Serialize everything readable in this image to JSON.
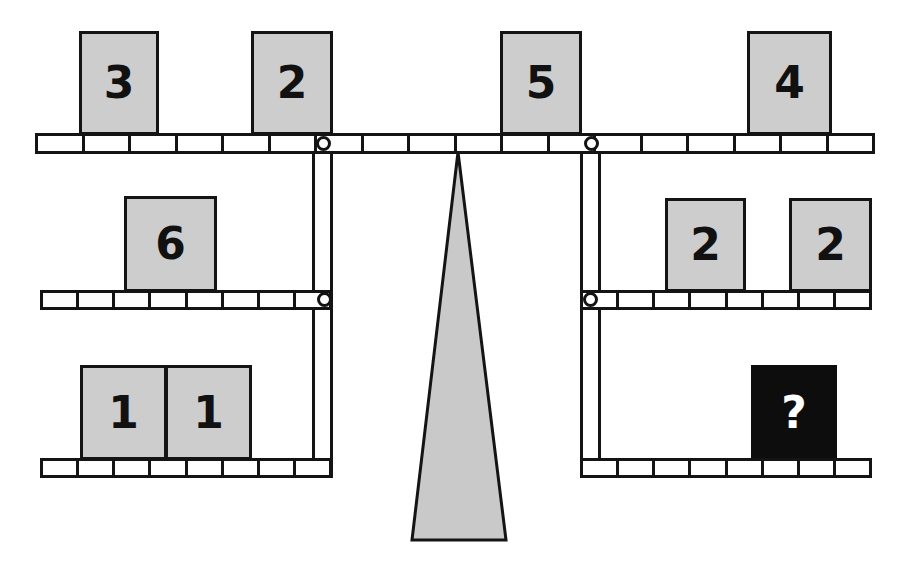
{
  "figure": {
    "colors": {
      "block_fill": "#cdcdcd",
      "unknown_fill": "#0d0d0d",
      "unknown_text": "#ffffff",
      "stroke": "#141414",
      "fulcrum_fill": "#c9c9c9",
      "background": "#ffffff"
    }
  },
  "beams": {
    "top": {
      "name": "top-beam",
      "segments": 18,
      "x": 35,
      "y": 133,
      "width": 840,
      "height": 21
    },
    "middle_left": {
      "name": "middle-left-beam",
      "segments": 8,
      "x": 40,
      "y": 290,
      "width": 292,
      "height": 20
    },
    "middle_right": {
      "name": "middle-right-beam",
      "segments": 8,
      "x": 580,
      "y": 290,
      "width": 292,
      "height": 20
    },
    "bottom_left": {
      "name": "bottom-left-beam",
      "segments": 8,
      "x": 40,
      "y": 458,
      "width": 292,
      "height": 20
    },
    "bottom_right": {
      "name": "bottom-right-beam",
      "segments": 8,
      "x": 580,
      "y": 458,
      "width": 292,
      "height": 20
    }
  },
  "pivots": [
    {
      "name": "top-beam-left-pivot",
      "x": 316,
      "y": 136
    },
    {
      "name": "top-beam-right-pivot",
      "x": 584,
      "y": 136
    },
    {
      "name": "middle-left-beam-pivot",
      "x": 317,
      "y": 292
    },
    {
      "name": "middle-right-beam-pivot",
      "x": 583,
      "y": 292
    }
  ],
  "rods": [
    {
      "name": "left-hanging-rod",
      "x": 312,
      "y": 143,
      "width": 21,
      "height": 335
    },
    {
      "name": "right-hanging-rod",
      "x": 580,
      "y": 143,
      "width": 21,
      "height": 335
    }
  ],
  "fulcrum": {
    "name": "fulcrum-triangle",
    "apex_x": 458,
    "apex_y": 152,
    "base_left_x": 412,
    "base_right_x": 506,
    "base_y": 540
  },
  "blocks": [
    {
      "name": "block-top-left-3",
      "label": "3",
      "unknown": false,
      "x": 79,
      "y": 31,
      "width": 80,
      "height": 104
    },
    {
      "name": "block-top-left-2",
      "label": "2",
      "unknown": false,
      "x": 251,
      "y": 31,
      "width": 82,
      "height": 104
    },
    {
      "name": "block-top-right-5",
      "label": "5",
      "unknown": false,
      "x": 500,
      "y": 31,
      "width": 82,
      "height": 104
    },
    {
      "name": "block-top-right-4",
      "label": "4",
      "unknown": false,
      "x": 747,
      "y": 31,
      "width": 85,
      "height": 104
    },
    {
      "name": "block-middle-left-6",
      "label": "6",
      "unknown": false,
      "x": 124,
      "y": 196,
      "width": 93,
      "height": 96
    },
    {
      "name": "block-middle-right-2a",
      "label": "2",
      "unknown": false,
      "x": 665,
      "y": 198,
      "width": 81,
      "height": 94
    },
    {
      "name": "block-middle-right-2b",
      "label": "2",
      "unknown": false,
      "x": 789,
      "y": 198,
      "width": 83,
      "height": 94
    },
    {
      "name": "block-bottom-left-1a",
      "label": "1",
      "unknown": false,
      "x": 80,
      "y": 365,
      "width": 87,
      "height": 95
    },
    {
      "name": "block-bottom-left-1b",
      "label": "1",
      "unknown": false,
      "x": 165,
      "y": 365,
      "width": 87,
      "height": 95
    },
    {
      "name": "block-bottom-right-unknown",
      "label": "?",
      "unknown": true,
      "x": 751,
      "y": 365,
      "width": 86,
      "height": 95
    }
  ],
  "chart_data": {
    "type": "diagram",
    "arms": [
      {
        "arm": "top-left",
        "blocks": [
          "3",
          "2"
        ]
      },
      {
        "arm": "top-right",
        "blocks": [
          "5",
          "4"
        ]
      },
      {
        "arm": "middle-left",
        "blocks": [
          "6"
        ]
      },
      {
        "arm": "middle-right",
        "blocks": [
          "2",
          "2"
        ]
      },
      {
        "arm": "bottom-left",
        "blocks": [
          "1",
          "1"
        ]
      },
      {
        "arm": "bottom-right",
        "blocks": [
          "?"
        ]
      }
    ],
    "unknown_label": "?"
  }
}
